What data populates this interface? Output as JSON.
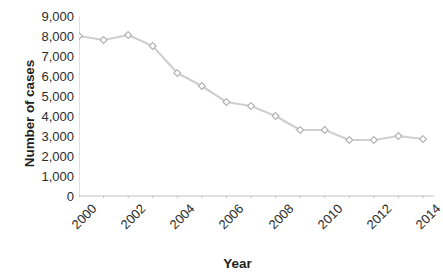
{
  "chart_data": {
    "type": "line",
    "title": "",
    "xlabel": "Year",
    "ylabel": "Number of cases",
    "x": [
      2000,
      2001,
      2002,
      2003,
      2004,
      2005,
      2006,
      2007,
      2008,
      2009,
      2010,
      2011,
      2012,
      2013,
      2014
    ],
    "values": [
      8000,
      7800,
      8050,
      7500,
      6150,
      5500,
      4700,
      4500,
      4000,
      3300,
      3300,
      2800,
      2800,
      3000,
      2850
    ],
    "series": [
      {
        "name": "Number of cases",
        "values": [
          8000,
          7800,
          8050,
          7500,
          6150,
          5500,
          4700,
          4500,
          4000,
          3300,
          3300,
          2800,
          2800,
          3000,
          2850
        ]
      }
    ],
    "ylim": [
      0,
      9000
    ],
    "xlim": [
      2000,
      2014
    ],
    "y_ticks": [
      0,
      1000,
      2000,
      3000,
      4000,
      5000,
      6000,
      7000,
      8000,
      9000
    ],
    "y_tick_labels": [
      "0",
      "1,000",
      "2,000",
      "3,000",
      "4,000",
      "5,000",
      "6,000",
      "7,000",
      "8,000",
      "9,000"
    ],
    "x_ticks": [
      2000,
      2001,
      2002,
      2003,
      2004,
      2005,
      2006,
      2007,
      2008,
      2009,
      2010,
      2011,
      2012,
      2013,
      2014
    ],
    "x_tick_labels": [
      "2000",
      "",
      "2002",
      "",
      "2004",
      "",
      "2006",
      "",
      "2008",
      "",
      "2010",
      "",
      "2012",
      "",
      "2014"
    ],
    "x_tick_labels_shown": [
      "2000",
      "2002",
      "2004",
      "2006",
      "2008",
      "2010",
      "2012",
      "2014"
    ],
    "x_tick_label_rotation": -45,
    "grid": false,
    "legend": "none",
    "line_color": "#cfcfcf",
    "marker_color": "#b3b3b3",
    "marker_fill": "#ffffff",
    "marker_shape": "diamond",
    "axis_color": "#bfbfbf",
    "text_color": "#231f20"
  },
  "axes": {
    "y_title": "Number of cases",
    "x_title": "Year"
  },
  "caption": {
    "text": ""
  }
}
